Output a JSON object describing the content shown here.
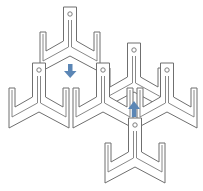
{
  "diagram": {
    "colors": {
      "outline": "#6f6f6f",
      "arrow": "#5b86b5",
      "background": "#ffffff"
    },
    "pieces": [
      {
        "id": "piece-top",
        "cx": 70,
        "top": 7
      },
      {
        "id": "piece-middle-top",
        "cx": 134,
        "top": 43
      },
      {
        "id": "piece-left",
        "cx": 39,
        "top": 63
      },
      {
        "id": "piece-center",
        "cx": 103,
        "top": 63
      },
      {
        "id": "piece-right",
        "cx": 167,
        "top": 63
      },
      {
        "id": "piece-bottom",
        "cx": 135,
        "top": 118
      }
    ],
    "arrows": [
      {
        "id": "arrow-down",
        "direction": "down",
        "x": 70,
        "y": 63
      },
      {
        "id": "arrow-up",
        "direction": "up",
        "x": 134,
        "y": 100
      }
    ]
  }
}
